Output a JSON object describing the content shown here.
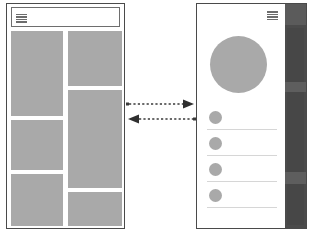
{
  "diagram": {
    "colors": {
      "frame_border": "#4a4a4a",
      "placeholder_block": "#a9a9a9",
      "divider": "#d6d6d6",
      "side_rail_dark": "#4b4b4b",
      "side_rail_inner": "#474747",
      "icon_gray": "#6d6d6d",
      "background": "#ffffff"
    }
  },
  "left_panel": {
    "name": "Desktop wireframe",
    "header": {
      "menu_icon": "hamburger-menu-icon",
      "bar_count": 4
    },
    "grid": {
      "type": "masonry",
      "columns": 2,
      "blocks": [
        {
          "id": "block-1",
          "column": "left",
          "size": "tall"
        },
        {
          "id": "block-2",
          "column": "left",
          "size": "medium"
        },
        {
          "id": "block-3",
          "column": "left",
          "size": "medium"
        },
        {
          "id": "block-4",
          "column": "right",
          "size": "medium"
        },
        {
          "id": "block-5",
          "column": "right",
          "size": "tall"
        },
        {
          "id": "block-6",
          "column": "right",
          "size": "medium"
        }
      ]
    }
  },
  "right_panel": {
    "name": "Mobile wireframe",
    "header": {
      "menu_icon": "hamburger-menu-icon",
      "bar_count": 4
    },
    "hero": {
      "shape": "circle",
      "id": "hero-avatar"
    },
    "list": {
      "item_count": 4,
      "items": [
        {
          "id": "list-item-1",
          "avatar": "circle",
          "divider": true
        },
        {
          "id": "list-item-2",
          "avatar": "circle",
          "divider": true
        },
        {
          "id": "list-item-3",
          "avatar": "circle",
          "divider": true
        },
        {
          "id": "list-item-4",
          "avatar": "circle",
          "divider": true
        }
      ]
    },
    "side_rail": {
      "id": "scroll-rail",
      "segments": 3
    }
  },
  "connector": {
    "arrows": [
      {
        "id": "arrow-to-right",
        "direction": "right",
        "style": "dashed"
      },
      {
        "id": "arrow-to-left",
        "direction": "left",
        "style": "dashed"
      }
    ],
    "stroke_color": "#3a3a3a"
  }
}
